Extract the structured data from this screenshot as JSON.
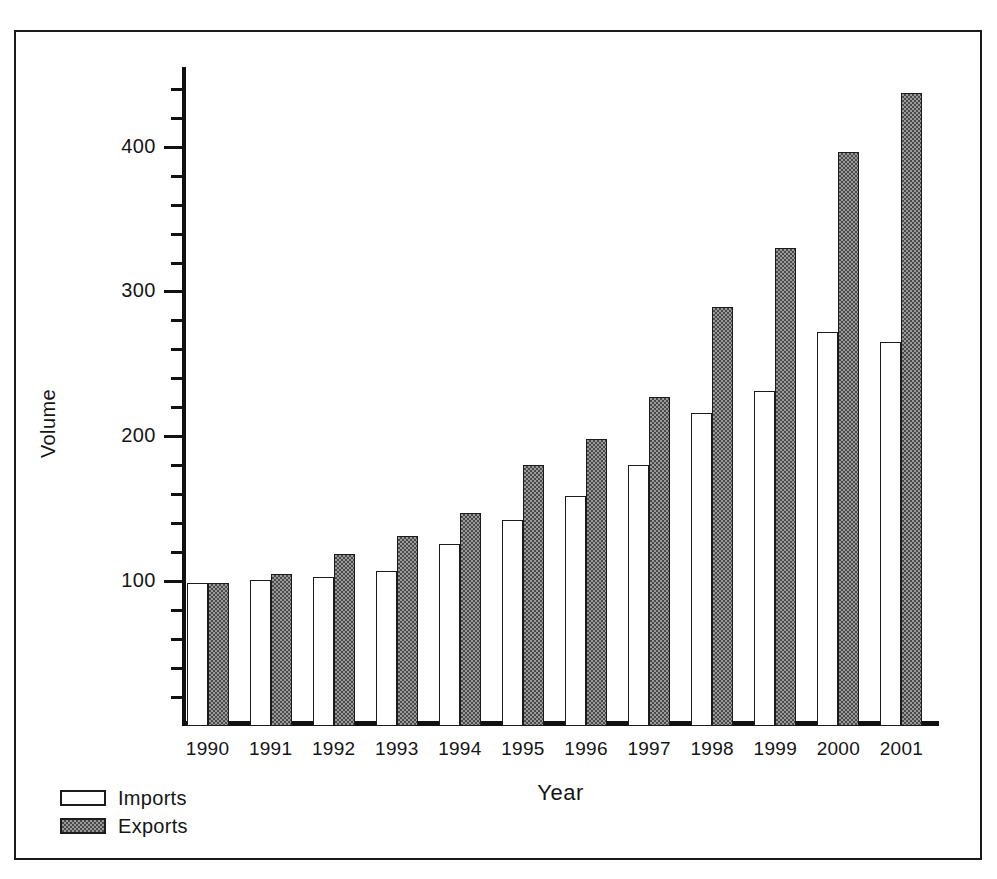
{
  "chart_data": {
    "type": "bar",
    "title": "",
    "xlabel": "Year",
    "ylabel": "Volume",
    "categories": [
      "1990",
      "1991",
      "1992",
      "1993",
      "1994",
      "1995",
      "1996",
      "1997",
      "1998",
      "1999",
      "2000",
      "2001"
    ],
    "series": [
      {
        "name": "Imports",
        "values": [
          99,
          101,
          103,
          107,
          126,
          142,
          159,
          180,
          216,
          231,
          272,
          265
        ]
      },
      {
        "name": "Exports",
        "values": [
          99,
          105,
          119,
          131,
          147,
          180,
          198,
          227,
          289,
          330,
          396,
          437
        ]
      }
    ],
    "ylim": [
      0,
      455
    ],
    "y_major_ticks": [
      100,
      200,
      300,
      400
    ],
    "y_major_tick_labels": [
      "100",
      "200",
      "300",
      "400"
    ],
    "y_minor_tick_interval": 20,
    "grid": false,
    "legend_position": "bottom-left",
    "colors": {
      "imports_fill": "#ffffff",
      "exports_fill": "#9a9a9a",
      "outline": "#1b1b1b",
      "axis": "#111111",
      "text": "#151515",
      "frame": "#1a1a1a",
      "background": "#ffffff"
    }
  },
  "axes": {
    "y_title": "Volume",
    "x_title": "Year"
  },
  "legend": {
    "items": [
      {
        "label": "Imports",
        "swatch": "white-outlined-box"
      },
      {
        "label": "Exports",
        "swatch": "hatched-gray-box"
      }
    ]
  }
}
